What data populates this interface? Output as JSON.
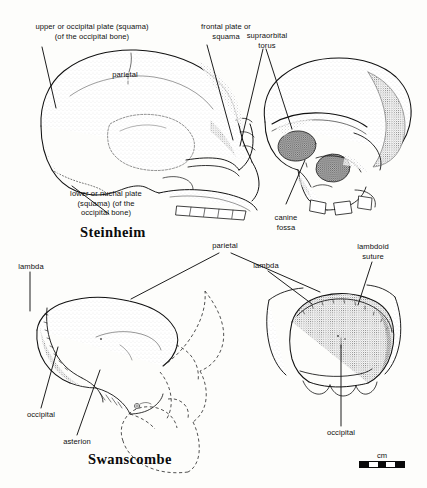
{
  "figure": {
    "background_color": "#fdfdfb",
    "ink_color": "#101010",
    "specimens": [
      {
        "caption": "Steinheim",
        "views": [
          "left lateral cranium",
          "anterolateral facial cranium"
        ]
      },
      {
        "caption": "Swanscombe",
        "views": [
          "left lateral occipital fragment with dashed reconstruction",
          "posterior occipital view"
        ]
      }
    ]
  },
  "steinheim": {
    "caption": "Steinheim",
    "labels": {
      "upper_occipital_plate": "upper or occipital plate (squama)\n(of the occipital bone)",
      "frontal_plate": "frontal plate or\nsquama",
      "supraorbital_torus": "supraorbital\ntorus",
      "parietal": "parietal",
      "lower_nuchal_plate": "lower or nuchal plate\n(squama) (of the\noccipital bone)",
      "canine_fossa": "canine\nfossa"
    }
  },
  "swanscombe": {
    "caption": "Swanscombe",
    "labels": {
      "parietal": "parietal",
      "lambdoid_suture": "lambdoid\nsuture",
      "lambda_left": "lambda",
      "lambda_right": "lambda",
      "occipital_left": "occipital",
      "asterion": "asterion",
      "occipital_right": "occipital"
    }
  },
  "scale": {
    "unit_label": "cm",
    "segments": [
      "on",
      "off",
      "on",
      "off",
      "on"
    ]
  }
}
